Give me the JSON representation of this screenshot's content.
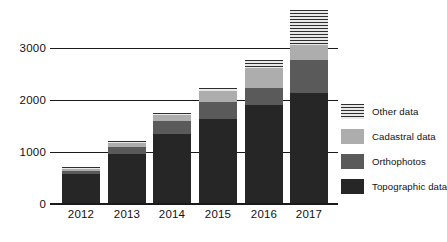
{
  "chart_data": {
    "type": "bar",
    "title": "",
    "subtitle": "",
    "xlabel": "",
    "ylabel": "",
    "stacked": true,
    "grid": true,
    "legend_position": "right",
    "categories": [
      "2012",
      "2013",
      "2014",
      "2015",
      "2016",
      "2017"
    ],
    "yticks": [
      "0",
      "1000",
      "2000",
      "3000"
    ],
    "ytick_values": [
      0,
      1000,
      2000,
      3000
    ],
    "ylim": [
      0,
      3800
    ],
    "series": [
      {
        "name": "Topographic data",
        "color": "#262626",
        "pattern": "solid",
        "values": [
          560,
          940,
          1330,
          1620,
          1900,
          2120
        ]
      },
      {
        "name": "Orthophotos",
        "color": "#5a5a5a",
        "pattern": "solid",
        "values": [
          60,
          140,
          250,
          330,
          330,
          650
        ]
      },
      {
        "name": "Cadastral data",
        "color": "#adadad",
        "pattern": "solid",
        "values": [
          40,
          75,
          115,
          210,
          380,
          290
        ]
      },
      {
        "name": "Other data",
        "color": "#2e2e2e",
        "pattern": "horizontal-stripes",
        "values": [
          30,
          55,
          55,
          70,
          160,
          670
        ]
      }
    ],
    "totals": [
      690,
      1210,
      1750,
      2230,
      2770,
      3730
    ]
  },
  "legend": {
    "items": [
      {
        "label": "Other data",
        "swatch": "other-data-swatch"
      },
      {
        "label": "Cadastral data",
        "swatch": "cadastral-data-swatch"
      },
      {
        "label": "Orthophotos",
        "swatch": "orthophotos-swatch"
      },
      {
        "label": "Topographic data",
        "swatch": "topographic-data-swatch"
      }
    ]
  }
}
